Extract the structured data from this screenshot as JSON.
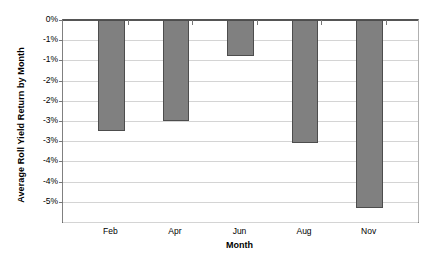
{
  "chart_data": {
    "type": "bar",
    "title": "",
    "xlabel": "Month",
    "ylabel": "Average Roll Yield Return by Month",
    "categories": [
      "Feb",
      "Apr",
      "Jun",
      "Aug",
      "Nov"
    ],
    "values": [
      -2.75,
      -2.5,
      -0.9,
      -3.05,
      -4.65
    ],
    "value_unit": "%",
    "ylim": [
      -5,
      0
    ],
    "ytick_values": [
      0,
      -0.5,
      -1.0,
      -1.5,
      -2.0,
      -2.5,
      -3.0,
      -3.5,
      -4.0,
      -4.5,
      -5.0
    ],
    "ytick_labels": [
      "0%",
      "-1%",
      "-1%",
      "-2%",
      "-2%",
      "-3%",
      "-3%",
      "-4%",
      "-4%",
      "-5%"
    ],
    "grid": true,
    "legend": false,
    "series": [
      {
        "name": "Average Roll Yield Return by Month",
        "color": "#808080",
        "border_color": "#4d4d4d",
        "values": [
          -2.75,
          -2.5,
          -0.9,
          -3.05,
          -4.65
        ]
      }
    ],
    "bar_slots": 11,
    "bar_slot_index": [
      1,
      3,
      5,
      7,
      9
    ]
  },
  "colors": {
    "bar_fill": "#808080",
    "bar_border": "#4d4d4d",
    "gridline": "#d4d4d4",
    "axis": "#555555",
    "background": "#ffffff",
    "text": "#000000"
  }
}
